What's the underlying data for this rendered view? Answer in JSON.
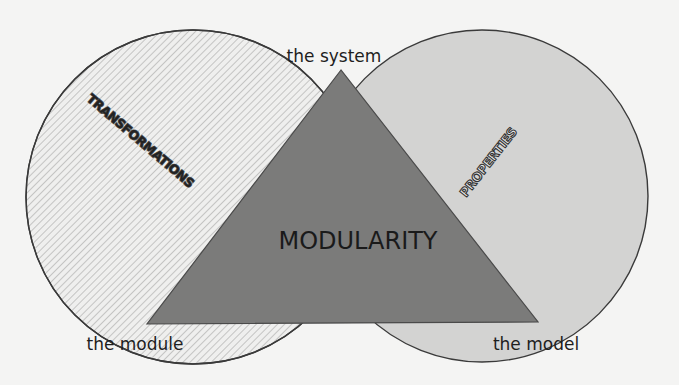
{
  "diagram": {
    "title": "MODULARITY",
    "vertices": {
      "top": "the system",
      "bottom_left": "the module",
      "bottom_right": "the model"
    },
    "circles": {
      "left": {
        "label": "TRANSFORMATIONS",
        "fill_style": "diagonal-hatch",
        "fill": "#ebebea"
      },
      "right": {
        "label": "PROPERTIES",
        "fill_style": "solid-light-gray",
        "fill": "#d2d2d1"
      }
    },
    "triangle": {
      "fill": "#7a7a79"
    },
    "colors": {
      "background": "#f4f4f3",
      "outline": "#3a3a3a"
    }
  }
}
